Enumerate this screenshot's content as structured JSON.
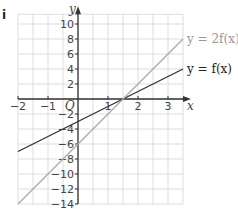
{
  "part_label": "i",
  "chart_data": {
    "type": "line",
    "title": "",
    "xlabel": "x",
    "ylabel": "y",
    "origin_label": "O",
    "xlim": [
      -2,
      3.5
    ],
    "ylim": [
      -14,
      11
    ],
    "grid": true,
    "x_ticks": [
      -2,
      -1,
      1,
      2,
      3
    ],
    "y_ticks": [
      10,
      8,
      6,
      4,
      2,
      -2,
      -4,
      -6,
      -8,
      -10,
      -12,
      -14
    ],
    "series": [
      {
        "name": "y = f(x)",
        "label": "y = f(x)",
        "color": "#333333",
        "x": [
          -2,
          3.5
        ],
        "y": [
          -7,
          4
        ]
      },
      {
        "name": "y = 2f(x)",
        "label": "y = 2f(x)",
        "color": "#a8a8a8",
        "x": [
          -2,
          3.5
        ],
        "y": [
          -14,
          8
        ]
      }
    ],
    "legend_position": "right, inline labels at line ends"
  }
}
